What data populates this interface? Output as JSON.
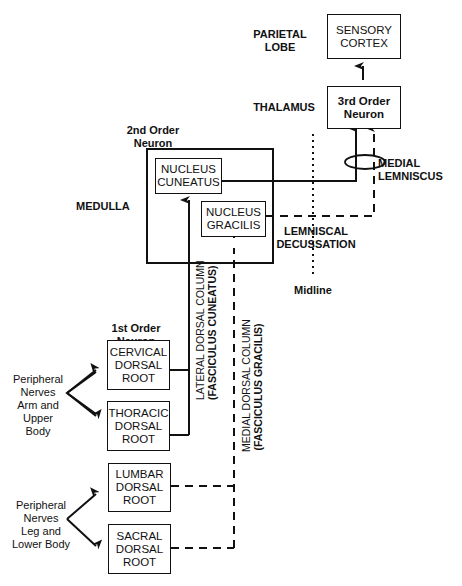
{
  "regions": {
    "parietal": "PARIETAL\nLOBE",
    "thalamus": "THALAMUS",
    "medulla": "MEDULLA"
  },
  "boxes": {
    "sensory_cortex": "SENSORY\nCORTEX",
    "third_order": "3rd Order\nNeuron",
    "nucleus_cuneatus": "NUCLEUS\nCUNEATUS",
    "nucleus_gracilis": "NUCLEUS\nGRACILIS",
    "cervical": "CERVICAL\nDORSAL\nROOT",
    "thoracic": "THORACIC\nDORSAL\nROOT",
    "lumbar": "LUMBAR\nDORSAL\nROOT",
    "sacral": "SACRAL\nDORSAL\nROOT"
  },
  "labels": {
    "second_order": "2nd Order\nNeuron",
    "first_order": "1st Order\nNeuron",
    "medial_lemniscus": "MEDIAL\nLEMNISCUS",
    "lemniscal_decussation": "LEMNISCAL\nDECUSSATION",
    "midline": "Midline",
    "peripheral_upper": "Peripheral\nNerves\nArm and\nUpper Body",
    "peripheral_lower": "Peripheral\nNerves\nLeg and\nLower Body",
    "lateral_column": "LATERAL DORSAL COLUMN",
    "lateral_column_sub": "(FASCICULUS CUNEATUS)",
    "medial_column": "MEDIAL DORSAL COLUMN",
    "medial_column_sub": "(FASCICULUS GRACILIS)"
  }
}
